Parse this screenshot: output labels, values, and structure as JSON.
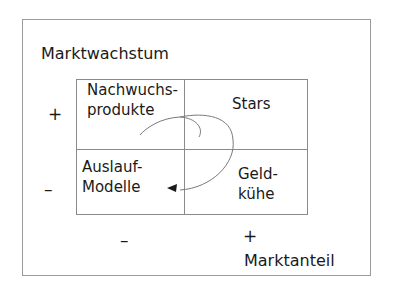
{
  "diagram": {
    "y_axis": {
      "label": "Marktwachstum",
      "high": "+",
      "low": "–"
    },
    "x_axis": {
      "label": "Marktanteil",
      "low": "–",
      "high": "+"
    },
    "quadrants": {
      "top_left": {
        "line1": "Nachwuchs-",
        "line2": "produkte"
      },
      "top_right": {
        "line1": "Stars"
      },
      "bottom_left": {
        "line1": "Auslauf-",
        "line2": "Modelle"
      },
      "bottom_right": {
        "line1": "Geld-",
        "line2": "kühe"
      }
    },
    "cycle_arrow": {
      "from": "Nachwuchsprodukte",
      "via": [
        "Stars",
        "Geldkühe"
      ],
      "to": "Auslauf-Modelle"
    },
    "colors": {
      "lines": "#8a8a8a",
      "text": "#1a1a1a",
      "frame": "#9a9a9a"
    }
  }
}
